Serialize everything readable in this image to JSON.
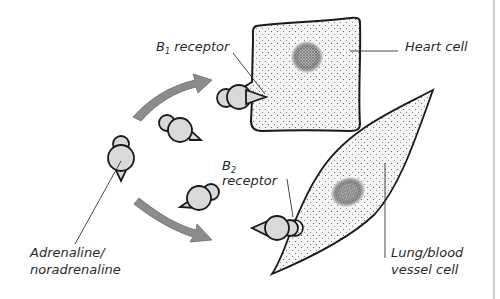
{
  "diagram": {
    "labels": {
      "b1_receptor_prefix": "B",
      "b1_receptor_sub": "1",
      "b1_receptor_suffix": " receptor",
      "b2_receptor_prefix": "B",
      "b2_receptor_sub": "2",
      "b2_receptor_suffix": "receptor",
      "heart_cell": "Heart cell",
      "ligand_line1": "Adrenaline/",
      "ligand_line2": "noradrenaline",
      "lung_line1": "Lung/blood",
      "lung_line2": "vessel cell"
    },
    "colors": {
      "cell_fill": "#f4f4f4",
      "nucleus": "#7a7a7a",
      "molecule_fill": "#d9d9d9",
      "arrow_fill": "#8c8c8c",
      "outline": "#1a1a1a"
    },
    "icons": {
      "molecule": "adrenaline-molecule-icon",
      "arrow": "curved-arrow-icon"
    }
  }
}
